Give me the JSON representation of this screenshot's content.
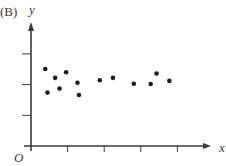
{
  "panel_label": "(B)",
  "chart_data": {
    "type": "scatter",
    "title": "",
    "xlabel": "x",
    "ylabel": "y",
    "origin_label": "O",
    "grid": false,
    "legend": null,
    "xlim": [
      0,
      4.8
    ],
    "ylim": [
      0,
      3.9
    ],
    "x_ticks": [
      1,
      2,
      3,
      4
    ],
    "y_ticks": [
      1,
      2,
      3
    ],
    "tick_labels_shown": false,
    "points": [
      {
        "x": 0.39,
        "y": 2.51
      },
      {
        "x": 0.45,
        "y": 1.74
      },
      {
        "x": 0.66,
        "y": 2.22
      },
      {
        "x": 0.78,
        "y": 1.87
      },
      {
        "x": 0.96,
        "y": 2.4
      },
      {
        "x": 1.27,
        "y": 2.06
      },
      {
        "x": 1.31,
        "y": 1.66
      },
      {
        "x": 1.88,
        "y": 2.14
      },
      {
        "x": 2.24,
        "y": 2.22
      },
      {
        "x": 2.81,
        "y": 2.03
      },
      {
        "x": 3.27,
        "y": 2.02
      },
      {
        "x": 3.43,
        "y": 2.36
      },
      {
        "x": 3.78,
        "y": 2.12
      }
    ]
  },
  "colors": {
    "axis": "#3a3a3a",
    "point": "#1e1e1e"
  }
}
